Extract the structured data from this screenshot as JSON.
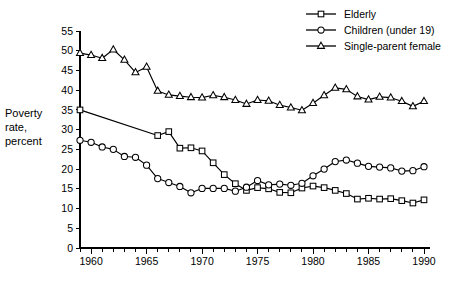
{
  "chart_data": {
    "type": "line",
    "title": "",
    "xlabel": "",
    "ylabel": "Poverty rate, percent",
    "ylabel_lines": [
      "Poverty",
      "rate,",
      "percent"
    ],
    "xlim": [
      1959,
      1990
    ],
    "ylim": [
      0,
      55
    ],
    "ytick_step": 5,
    "yticks": [
      0,
      5,
      10,
      15,
      20,
      25,
      30,
      35,
      40,
      45,
      50,
      55
    ],
    "ytick_labels": [
      "0",
      "5",
      "10",
      "15",
      "20",
      "25",
      "30",
      "35",
      "40",
      "45",
      "50",
      "55"
    ],
    "xticks_major": [
      1960,
      1965,
      1970,
      1975,
      1980,
      1985,
      1990
    ],
    "xtick_labels": [
      "1960",
      "1965",
      "1970",
      "1975",
      "1980",
      "1985",
      "1990"
    ],
    "xticks_minor_step": 1,
    "grid": false,
    "legend_position": "top-right",
    "series": [
      {
        "name": "Elderly",
        "marker": "square",
        "x": [
          1959,
          1966,
          1967,
          1968,
          1969,
          1970,
          1971,
          1972,
          1973,
          1974,
          1975,
          1976,
          1977,
          1978,
          1979,
          1980,
          1981,
          1982,
          1983,
          1984,
          1985,
          1986,
          1987,
          1988,
          1989,
          1990
        ],
        "values": [
          35.0,
          28.5,
          29.5,
          25.3,
          25.4,
          24.6,
          21.6,
          18.6,
          16.3,
          14.6,
          15.3,
          15.0,
          14.1,
          14.0,
          15.2,
          15.7,
          15.3,
          14.6,
          13.8,
          12.4,
          12.6,
          12.4,
          12.5,
          12.0,
          11.4,
          12.2
        ]
      },
      {
        "name": "Children (under 19)",
        "marker": "circle",
        "x": [
          1959,
          1960,
          1961,
          1962,
          1963,
          1964,
          1965,
          1966,
          1967,
          1968,
          1969,
          1970,
          1971,
          1972,
          1973,
          1974,
          1975,
          1976,
          1977,
          1978,
          1979,
          1980,
          1981,
          1982,
          1983,
          1984,
          1985,
          1986,
          1987,
          1988,
          1989,
          1990
        ],
        "values": [
          27.3,
          26.8,
          25.6,
          25.0,
          23.2,
          23.0,
          21.0,
          17.6,
          16.6,
          15.6,
          14.0,
          15.1,
          15.1,
          15.1,
          14.4,
          15.4,
          17.1,
          16.0,
          16.2,
          15.9,
          16.4,
          18.3,
          20.0,
          21.9,
          22.3,
          21.5,
          20.7,
          20.5,
          20.3,
          19.5,
          19.6,
          20.6
        ]
      },
      {
        "name": "Single-parent female",
        "marker": "triangle",
        "x": [
          1959,
          1960,
          1961,
          1962,
          1963,
          1964,
          1965,
          1966,
          1967,
          1968,
          1969,
          1970,
          1971,
          1972,
          1973,
          1974,
          1975,
          1976,
          1977,
          1978,
          1979,
          1980,
          1981,
          1982,
          1983,
          1984,
          1985,
          1986,
          1987,
          1988,
          1989,
          1990
        ],
        "values": [
          49.4,
          48.9,
          48.1,
          50.3,
          47.7,
          44.5,
          45.9,
          39.8,
          38.8,
          38.5,
          38.2,
          38.1,
          38.7,
          38.2,
          37.5,
          36.5,
          37.5,
          37.3,
          36.2,
          35.6,
          34.9,
          36.7,
          38.7,
          40.6,
          40.2,
          38.4,
          37.6,
          38.3,
          38.1,
          37.2,
          35.9,
          37.2
        ]
      }
    ],
    "legend": [
      {
        "label": "Elderly",
        "marker": "square"
      },
      {
        "label": "Children (under 19)",
        "marker": "circle"
      },
      {
        "label": "Single-parent female",
        "marker": "triangle"
      }
    ]
  }
}
